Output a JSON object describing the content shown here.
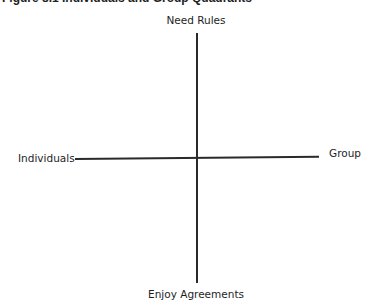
{
  "caption": {
    "text": "Figure 8.1 Individuals and Group Quadrants"
  },
  "diagram": {
    "type": "quadrant",
    "axes": {
      "vertical": {
        "top_label": "Need Rules",
        "bottom_label": "Enjoy Agreements"
      },
      "horizontal": {
        "left_label": "Individuals",
        "right_label": "Group"
      }
    },
    "line_color": "#2a2a2a"
  }
}
